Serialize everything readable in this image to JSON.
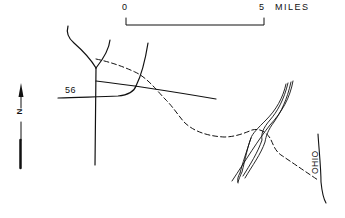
{
  "scale_bar": {
    "start_label": "0",
    "end_label": "5",
    "unit_label": "MILES"
  },
  "north_arrow": {
    "label": "N"
  },
  "labels": {
    "route": "56",
    "river": "OHIO"
  },
  "colors": {
    "ink": "#111111",
    "background": "#ffffff"
  }
}
